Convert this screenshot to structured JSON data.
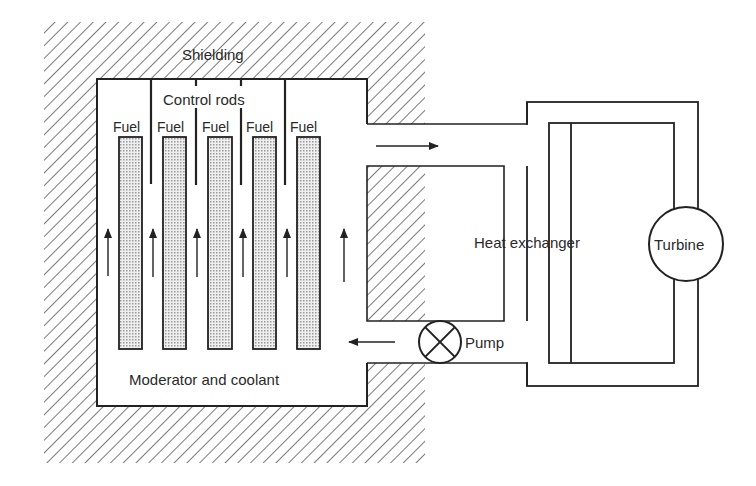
{
  "diagram": {
    "type": "nuclear reactor schematic",
    "labels": {
      "shielding": "Shielding",
      "control_rods": "Control rods",
      "fuel": [
        "Fuel",
        "Fuel",
        "Fuel",
        "Fuel",
        "Fuel"
      ],
      "moderator": "Moderator and coolant",
      "heat_exchanger": "Heat exchanger",
      "pump": "Pump",
      "turbine": "Turbine"
    },
    "counts": {
      "fuel_rods": 5,
      "control_rods": 4,
      "flow_arrows_core": 6
    },
    "colors": {
      "line": "#222222",
      "fuel_fill": "#d9d9d9",
      "background": "#ffffff"
    }
  }
}
